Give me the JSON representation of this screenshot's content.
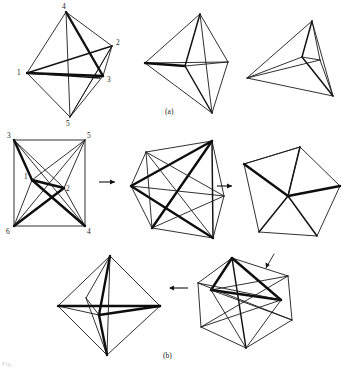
{
  "figure": {
    "title_caption_a": "(a)",
    "title_caption_b": "(b)",
    "footer_fragment": "Fig.",
    "stroke_color": "#1a1a1a",
    "background_color": "#ffffff",
    "accent_heavy_color": "#0d0d0d"
  },
  "row_a": {
    "label": "(a)",
    "shapes": [
      {
        "name": "labeled-octahedron",
        "vertex_labels": [
          {
            "text": "4",
            "x": 62,
            "y": 8
          },
          {
            "text": "2",
            "x": 116,
            "y": 44
          },
          {
            "text": "1",
            "x": 17,
            "y": 72
          },
          {
            "text": "3",
            "x": 113,
            "y": 79
          },
          {
            "text": "5",
            "x": 66,
            "y": 121
          }
        ]
      },
      {
        "name": "collapsed-octahedron-middle",
        "vertex_labels": []
      },
      {
        "name": "tetrahedron-right",
        "vertex_labels": []
      }
    ]
  },
  "row_b": {
    "label": "(b)",
    "shapes": [
      {
        "name": "labeled-square-graph",
        "vertex_labels": [
          {
            "text": "3",
            "x": 6,
            "y": 136
          },
          {
            "text": "5",
            "x": 88,
            "y": 136
          },
          {
            "text": "1",
            "x": 24,
            "y": 179
          },
          {
            "text": "2",
            "x": 68,
            "y": 188
          },
          {
            "text": "6",
            "x": 6,
            "y": 231
          },
          {
            "text": "4",
            "x": 88,
            "y": 231
          }
        ]
      },
      {
        "name": "hexagonal-intermediate",
        "vertex_labels": []
      },
      {
        "name": "pentagonal-wheel",
        "vertex_labels": []
      },
      {
        "name": "octahedron-final",
        "vertex_labels": []
      },
      {
        "name": "hexagon-with-crossings",
        "vertex_labels": []
      }
    ],
    "arrows": [
      {
        "name": "arrow-right-1",
        "direction": "right",
        "x": 100,
        "y": 182
      },
      {
        "name": "arrow-right-2",
        "direction": "right",
        "x": 218,
        "y": 186
      },
      {
        "name": "arrow-left-1",
        "direction": "left",
        "x": 168,
        "y": 288
      }
    ]
  }
}
